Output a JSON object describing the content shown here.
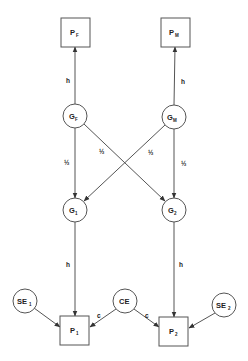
{
  "diagram": {
    "type": "path-diagram",
    "nodes": {
      "PF": {
        "label": "P",
        "sub": "F",
        "shape": "box",
        "cx": 75,
        "cy": 32
      },
      "PM": {
        "label": "P",
        "sub": "M",
        "shape": "box",
        "cx": 175,
        "cy": 32
      },
      "GF": {
        "label": "G",
        "sub": "F",
        "shape": "circle",
        "cx": 75,
        "cy": 116
      },
      "GM": {
        "label": "G",
        "sub": "M",
        "shape": "circle",
        "cx": 174,
        "cy": 117
      },
      "G1": {
        "label": "G",
        "sub": "1",
        "shape": "circle",
        "cx": 75,
        "cy": 210
      },
      "G2": {
        "label": "G",
        "sub": "2",
        "shape": "circle",
        "cx": 174,
        "cy": 210
      },
      "SE1": {
        "label": "SE",
        "sub": "1",
        "shape": "circle",
        "cx": 25,
        "cy": 301
      },
      "CE": {
        "label": "CE",
        "sub": "",
        "shape": "circle",
        "cx": 125,
        "cy": 301
      },
      "SE2": {
        "label": "SE",
        "sub": "2",
        "shape": "circle",
        "cx": 224,
        "cy": 305
      },
      "P1": {
        "label": "P",
        "sub": "1",
        "shape": "box",
        "cx": 75,
        "cy": 330
      },
      "P2": {
        "label": "P",
        "sub": "2",
        "shape": "box",
        "cx": 174,
        "cy": 331
      }
    },
    "edges": [
      {
        "from": "GF",
        "to": "PF",
        "label": "h"
      },
      {
        "from": "GM",
        "to": "PM",
        "label": "h"
      },
      {
        "from": "GF",
        "to": "G1",
        "label": "½"
      },
      {
        "from": "GF",
        "to": "G2",
        "label": "½"
      },
      {
        "from": "GM",
        "to": "G1",
        "label": "½"
      },
      {
        "from": "GM",
        "to": "G2",
        "label": "½"
      },
      {
        "from": "G1",
        "to": "P1",
        "label": "h"
      },
      {
        "from": "G2",
        "to": "P2",
        "label": "h"
      },
      {
        "from": "SE1",
        "to": "P1",
        "label": ""
      },
      {
        "from": "CE",
        "to": "P1",
        "label": "c"
      },
      {
        "from": "CE",
        "to": "P2",
        "label": "c"
      },
      {
        "from": "SE2",
        "to": "P2",
        "label": ""
      }
    ],
    "labels": {
      "h": "h",
      "half": "½",
      "c": "c"
    }
  }
}
